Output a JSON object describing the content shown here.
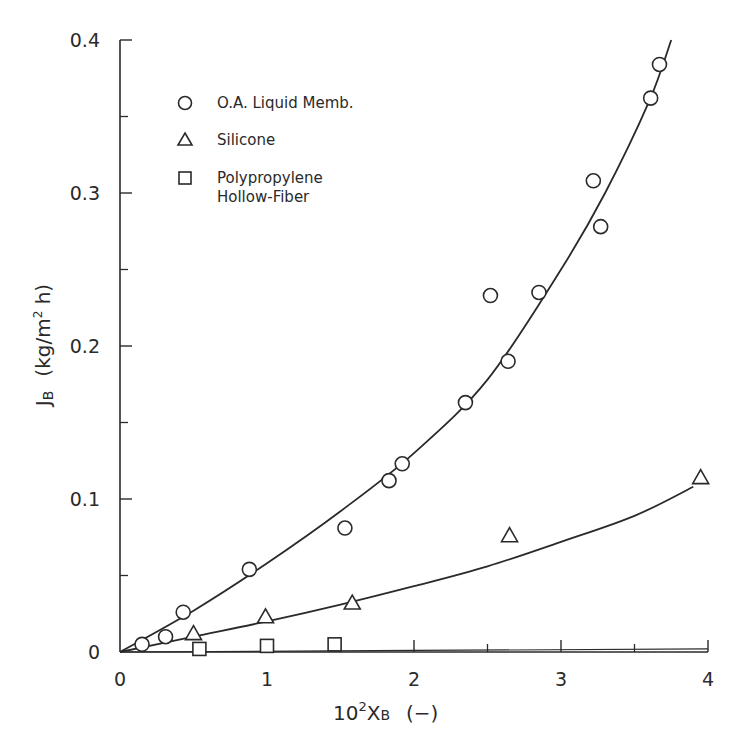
{
  "chart_data": {
    "type": "scatter",
    "title": "",
    "xlabel": "10²X_B (−)",
    "xlabel_main": "10",
    "xlabel_sup": "2",
    "xlabel_var": "X",
    "xlabel_sub": "B",
    "xlabel_unit": "(−)",
    "ylabel": "J_B (kg/m² h)",
    "ylabel_var": "J",
    "ylabel_sub": "B",
    "ylabel_unit_pre": "(kg/m",
    "ylabel_unit_sup": "2",
    "ylabel_unit_post": " h)",
    "xlim": [
      0,
      4
    ],
    "ylim": [
      0,
      0.4
    ],
    "x_ticks": [
      0,
      1,
      2,
      3,
      4
    ],
    "x_tick_labels": [
      "0",
      "1",
      "2",
      "3",
      "4"
    ],
    "x_minor_ticks": [
      0.5,
      1.5,
      2.5,
      3.5
    ],
    "y_ticks": [
      0,
      0.1,
      0.2,
      0.3,
      0.4
    ],
    "y_tick_labels": [
      "0",
      "0.1",
      "0.2",
      "0.3",
      "0.4"
    ],
    "y_minor_ticks": [
      0.05,
      0.15,
      0.25,
      0.35
    ],
    "grid": false,
    "legend_position": "upper-left",
    "series": [
      {
        "name": "O.A. Liquid Memb.",
        "marker": "circle",
        "x": [
          0.15,
          0.31,
          0.43,
          0.88,
          1.53,
          1.83,
          1.92,
          2.35,
          2.52,
          2.64,
          2.85,
          3.22,
          3.27,
          3.61,
          3.67
        ],
        "y": [
          0.005,
          0.01,
          0.026,
          0.054,
          0.081,
          0.112,
          0.123,
          0.163,
          0.233,
          0.19,
          0.235,
          0.308,
          0.278,
          0.362,
          0.384
        ],
        "fit_curve": {
          "x": [
            0,
            0.5,
            1.0,
            1.5,
            2.0,
            2.5,
            3.0,
            3.3,
            3.6,
            3.75
          ],
          "y": [
            0,
            0.027,
            0.058,
            0.092,
            0.13,
            0.178,
            0.25,
            0.3,
            0.36,
            0.4
          ]
        }
      },
      {
        "name": "Silicone",
        "marker": "triangle",
        "x": [
          0.5,
          0.99,
          1.58,
          2.65,
          3.95
        ],
        "y": [
          0.012,
          0.023,
          0.032,
          0.076,
          0.114
        ],
        "fit_curve": {
          "x": [
            0,
            0.5,
            1.0,
            1.5,
            2.0,
            2.5,
            3.0,
            3.5,
            3.9
          ],
          "y": [
            0,
            0.01,
            0.02,
            0.031,
            0.043,
            0.056,
            0.072,
            0.089,
            0.108
          ]
        }
      },
      {
        "name": "Polypropylene Hollow-Fiber",
        "name_line1": "Polypropylene",
        "name_line2": "Hollow-Fiber",
        "marker": "square",
        "x": [
          0.54,
          1.0,
          1.46
        ],
        "y": [
          0.002,
          0.004,
          0.005
        ],
        "fit_curve": {
          "x": [
            0,
            4
          ],
          "y": [
            0,
            0.002
          ]
        }
      }
    ]
  },
  "legend": {
    "items": [
      {
        "label": "O.A. Liquid Memb.",
        "marker": "circle"
      },
      {
        "label": "Silicone",
        "marker": "triangle"
      },
      {
        "label_line1": "Polypropylene",
        "label_line2": "Hollow-Fiber",
        "marker": "square"
      }
    ]
  },
  "colors": {
    "ink": "#2a2a2a",
    "background": "#ffffff"
  }
}
